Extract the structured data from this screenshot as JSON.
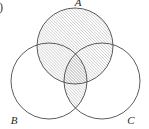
{
  "figure": {
    "kind": "venn-diagram-3-set",
    "width": 149,
    "height": 129,
    "background_color": "#ffffff",
    "stroke_color": "#4a4a4a",
    "hatch_color": "#8a8a8a",
    "label_color": "#2a2a2a",
    "shaded_region_expression": "A ∪ (B ∩ C)",
    "hatch": {
      "direction": "forward-slash",
      "angle_degrees": 45,
      "spacing_px": 2.1,
      "line_width_px": 0.6
    }
  },
  "enumeration": {
    "marker": ")"
  },
  "circles": [
    {
      "id": "A",
      "label": "A",
      "cx": 75,
      "cy": 46,
      "r": 38,
      "label_x": 78,
      "label_y": 6,
      "shaded": true
    },
    {
      "id": "B",
      "label": "B",
      "cx": 49,
      "cy": 81,
      "r": 38,
      "label_x": 14,
      "label_y": 124,
      "shaded": false
    },
    {
      "id": "C",
      "label": "C",
      "cx": 102,
      "cy": 81,
      "r": 38,
      "label_x": 131,
      "label_y": 124,
      "shaded": false
    }
  ]
}
